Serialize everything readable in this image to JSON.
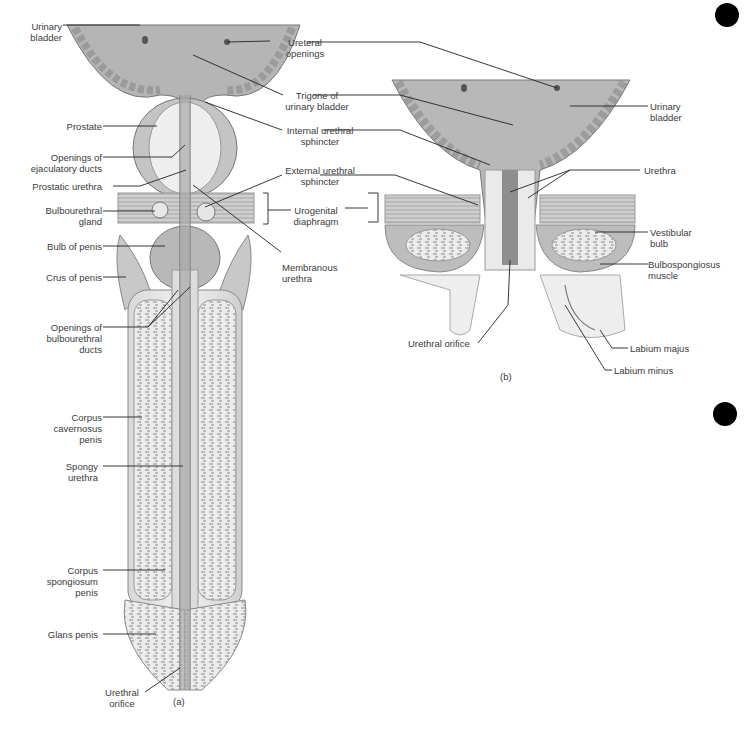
{
  "figure_a": {
    "caption": "(a)",
    "labels": {
      "urinary_bladder": [
        "Urinary",
        "bladder"
      ],
      "ureteral_openings": [
        "Ureteral",
        "openings"
      ],
      "trigone": [
        "Trigone of",
        "urinary bladder"
      ],
      "internal_sphincter": [
        "Internal urethral",
        "sphincter"
      ],
      "prostate": [
        "Prostate"
      ],
      "ejaculatory_ducts": [
        "Openings of",
        "ejaculatory ducts"
      ],
      "prostatic_urethra": [
        "Prostatic urethra"
      ],
      "external_sphincter": [
        "External urethral",
        "sphincter"
      ],
      "bulbourethral_gland": [
        "Bulbourethral",
        "gland"
      ],
      "urogenital_diaphragm": [
        "Urogenital",
        "diaphragm"
      ],
      "bulb_of_penis": [
        "Bulb of penis"
      ],
      "membranous_urethra": [
        "Membranous",
        "urethra"
      ],
      "crus_of_penis": [
        "Crus of penis"
      ],
      "bulbourethral_ducts": [
        "Openings of",
        "bulbourethral",
        "ducts"
      ],
      "corpus_cavernosum": [
        "Corpus",
        "cavernosus",
        "penis"
      ],
      "spongy_urethra": [
        "Spongy",
        "urethra"
      ],
      "corpus_spongiosum": [
        "Corpus",
        "spongiosum",
        "penis"
      ],
      "glans_penis": [
        "Glans penis"
      ],
      "urethral_orifice": [
        "Urethral",
        "orifice"
      ]
    }
  },
  "figure_b": {
    "caption": "(b)",
    "labels": {
      "urinary_bladder": [
        "Urinary",
        "bladder"
      ],
      "urethra": [
        "Urethra"
      ],
      "vestibular_bulb": [
        "Vestibular",
        "bulb"
      ],
      "bulbospongiosus": [
        "Bulbospongiosus",
        "muscle"
      ],
      "urethral_orifice": [
        "Urethral orifice"
      ],
      "labium_majus": [
        "Labium majus"
      ],
      "labium_minus": [
        "Labium minus"
      ]
    }
  },
  "colors": {
    "tissue_dark": "#9a9a9a",
    "tissue_mid": "#bdbdbd",
    "tissue_light": "#e4e4e4",
    "line": "#222222"
  }
}
